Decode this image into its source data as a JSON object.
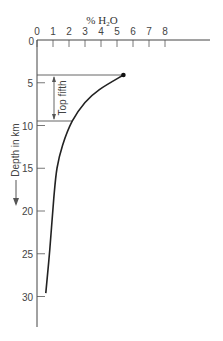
{
  "chart_data": {
    "type": "line",
    "title": "",
    "xlabel": "% H2O",
    "xlabel_main": "% H",
    "xlabel_sub": "2",
    "xlabel_tail": "O",
    "ylabel": "Depth in km",
    "x_axis_position": "top",
    "y_axis_inverted": true,
    "xlim": [
      0,
      8
    ],
    "ylim": [
      0,
      33
    ],
    "x_ticks": [
      0,
      1,
      2,
      3,
      4,
      5,
      6,
      7,
      8
    ],
    "y_ticks": [
      0,
      5,
      10,
      15,
      20,
      25,
      30
    ],
    "x_tick_labels": [
      "0",
      "1",
      "2",
      "3",
      "4",
      "5",
      "6",
      "7",
      "8"
    ],
    "y_tick_labels": [
      "0",
      "5",
      "10",
      "15",
      "20",
      "25",
      "30"
    ],
    "grid": false,
    "series": [
      {
        "name": "Water content vs depth",
        "x": [
          5.4,
          3.9,
          3.0,
          2.2,
          1.6,
          1.25,
          1.05,
          0.8,
          0.55
        ],
        "y": [
          4.1,
          5.8,
          7.3,
          9.5,
          12.3,
          15.0,
          18.5,
          24.5,
          29.6
        ]
      }
    ],
    "annotations": [
      {
        "text": "Top fifth",
        "type": "double-arrow-bracket",
        "y_range": [
          4.1,
          9.5
        ]
      }
    ],
    "marker": {
      "x": 5.4,
      "y": 4.1,
      "shape": "dot"
    }
  },
  "colors": {
    "line": "#222222",
    "axis": "#444444",
    "text": "#444444"
  }
}
